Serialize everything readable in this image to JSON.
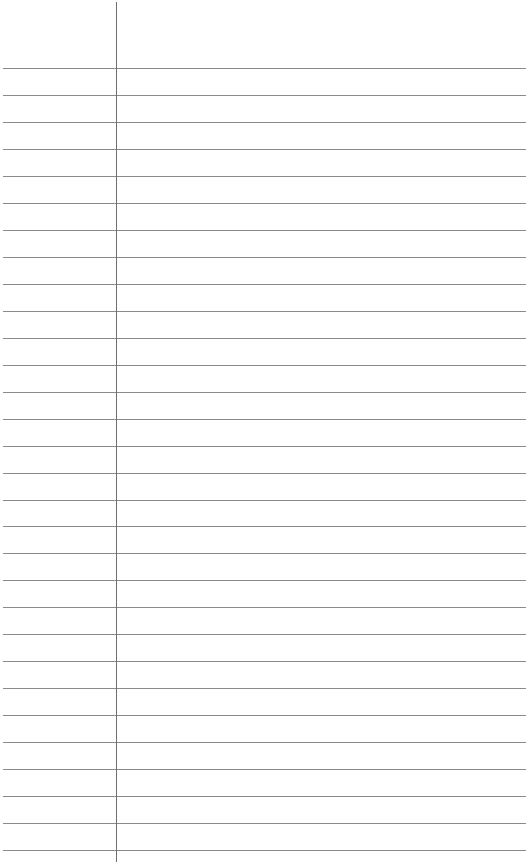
{
  "paper": {
    "type": "lined-paper",
    "rule_count": 30,
    "first_rule_y": 68,
    "rule_spacing": 26.97,
    "rule_color": "#8a8a8a",
    "margin_line_x": 116,
    "margin_color": "#6e6e6e",
    "background": "#ffffff"
  }
}
